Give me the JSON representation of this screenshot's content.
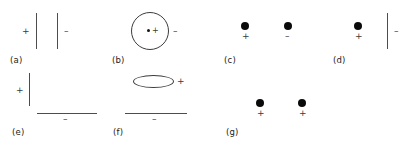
{
  "figure": {
    "width": 416,
    "height": 145,
    "background_color": "#ffffff",
    "stroke_color": "#4d4d4d",
    "charge_color": "#0a0a0a",
    "label_color": "#1a1a1a"
  },
  "symbols": {
    "plus": "+",
    "minus": "–"
  },
  "panels": [
    {
      "id": "a",
      "label": "(a)",
      "description": "Two parallel vertical charged plates, left plate positive, right plate negative",
      "signs": [
        {
          "name": "left-plate-positive",
          "text": "+"
        },
        {
          "name": "right-plate-negative",
          "text": "–"
        }
      ]
    },
    {
      "id": "b",
      "label": "(b)",
      "description": "Circular shell with a positive point charge at its center and a negative sign outside to the right",
      "signs": [
        {
          "name": "center-charge-positive",
          "text": "+"
        },
        {
          "name": "shell-negative",
          "text": "–"
        }
      ]
    },
    {
      "id": "c",
      "label": "(c)",
      "description": "Two point charges side by side, left positive and right negative",
      "signs": [
        {
          "name": "left-point-charge-positive",
          "text": "+"
        },
        {
          "name": "right-point-charge-negative",
          "text": "–"
        }
      ]
    },
    {
      "id": "d",
      "label": "(d)",
      "description": "A positive point charge beside a negatively charged vertical plate",
      "signs": [
        {
          "name": "point-charge-positive",
          "text": "+"
        },
        {
          "name": "plate-negative",
          "text": "–"
        }
      ]
    },
    {
      "id": "e",
      "label": "(e)",
      "description": "A positively charged vertical plate above a negatively charged horizontal plate",
      "signs": [
        {
          "name": "vertical-plate-positive",
          "text": "+"
        },
        {
          "name": "horizontal-plate-negative",
          "text": "–"
        }
      ]
    },
    {
      "id": "f",
      "label": "(f)",
      "description": "A positively charged flat ellipse above a negatively charged horizontal plate",
      "signs": [
        {
          "name": "ellipse-positive",
          "text": "+"
        },
        {
          "name": "horizontal-plate-negative",
          "text": "–"
        }
      ]
    },
    {
      "id": "g",
      "label": "(g)",
      "description": "Two positive point charges side by side",
      "signs": [
        {
          "name": "left-point-charge-positive",
          "text": "+"
        },
        {
          "name": "right-point-charge-positive",
          "text": "+"
        }
      ]
    }
  ]
}
